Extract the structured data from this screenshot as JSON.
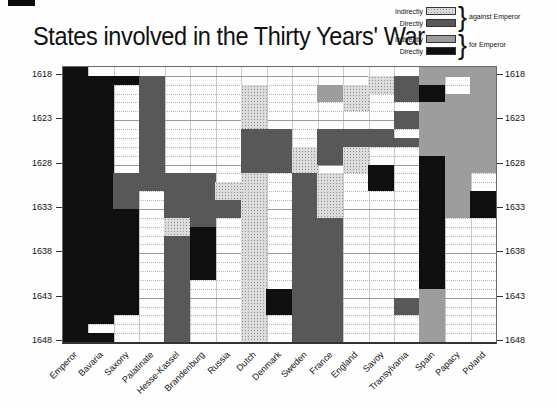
{
  "title": "States involved in the Thirty Years' War",
  "legend": {
    "brace": "}",
    "groups": [
      {
        "label": "against Emperor",
        "rows": [
          {
            "label": "Indirectly",
            "code": "IA"
          },
          {
            "label": "Directly",
            "code": "DA"
          }
        ]
      },
      {
        "label": "for Emperor",
        "rows": [
          {
            "label": "Indirectly",
            "code": "IF"
          },
          {
            "label": "Directly",
            "code": "DF"
          }
        ]
      }
    ]
  },
  "colors": {
    "indirect_against_bg": "#dcdcdc",
    "indirect_against_dot": "#8f8f8f",
    "direct_against": "#585858",
    "indirect_for": "#9d9d9d",
    "direct_for": "#0f0f0f",
    "grid_solid": "#9a9a9a",
    "grid_dotted": "#b3b3b3",
    "frame": "#6a6a6a"
  },
  "chart_data": {
    "type": "heatmap",
    "title": "States involved in the Thirty Years' War",
    "x_categories": [
      "Emperor",
      "Bavaria",
      "Saxony",
      "Palatinate",
      "Hesse-Kassel",
      "Brandenburg",
      "Russia",
      "Dutch",
      "Denmark",
      "Sweden",
      "France",
      "England",
      "Savoy",
      "Transylvania",
      "Spain",
      "Papacy",
      "Poland"
    ],
    "y_min": 1618,
    "y_max": 1648,
    "y_ticks": [
      1618,
      1623,
      1628,
      1633,
      1638,
      1643,
      1648
    ],
    "grid": "yearly dotted horizontal lines, solid lines every 5 years, vertical lines at column bounds",
    "codes": {
      "IA": "Indirectly against Emperor (stippled light gray)",
      "DA": "Directly against Emperor (dark gray)",
      "IF": "Indirectly for Emperor (medium gray)",
      "DF": "Directly for Emperor (black)",
      "default": "not involved (white)"
    },
    "states": [
      {
        "name": "Emperor",
        "segments": [
          [
            1618,
            1648,
            "DF"
          ]
        ]
      },
      {
        "name": "Bavaria",
        "segments": [
          [
            1619,
            1646,
            "DF"
          ],
          [
            1648,
            1648,
            "DF"
          ]
        ]
      },
      {
        "name": "Saxony",
        "segments": [
          [
            1619,
            1619,
            "DF"
          ],
          [
            1630,
            1633,
            "DA"
          ],
          [
            1634,
            1645,
            "DF"
          ]
        ]
      },
      {
        "name": "Palatinate",
        "segments": [
          [
            1619,
            1631,
            "DA"
          ]
        ]
      },
      {
        "name": "Hesse-Kassel",
        "segments": [
          [
            1630,
            1634,
            "DA"
          ],
          [
            1635,
            1636,
            "IA"
          ],
          [
            1637,
            1648,
            "DA"
          ]
        ]
      },
      {
        "name": "Brandenburg",
        "segments": [
          [
            1630,
            1635,
            "DA"
          ],
          [
            1636,
            1641,
            "DF"
          ]
        ]
      },
      {
        "name": "Russia",
        "segments": [
          [
            1631,
            1632,
            "IA"
          ],
          [
            1633,
            1634,
            "DA"
          ]
        ]
      },
      {
        "name": "Dutch",
        "segments": [
          [
            1620,
            1624,
            "IA"
          ],
          [
            1625,
            1629,
            "DA"
          ],
          [
            1630,
            1648,
            "IA"
          ]
        ]
      },
      {
        "name": "Denmark",
        "segments": [
          [
            1625,
            1629,
            "DA"
          ],
          [
            1643,
            1645,
            "DF"
          ]
        ]
      },
      {
        "name": "Sweden",
        "segments": [
          [
            1627,
            1629,
            "IA"
          ],
          [
            1630,
            1648,
            "DA"
          ]
        ]
      },
      {
        "name": "France",
        "segments": [
          [
            1620,
            1621,
            "IF"
          ],
          [
            1625,
            1628,
            "DA"
          ],
          [
            1630,
            1634,
            "IA"
          ],
          [
            1635,
            1648,
            "DA"
          ]
        ]
      },
      {
        "name": "England",
        "segments": [
          [
            1620,
            1622,
            "IA"
          ],
          [
            1625,
            1626,
            "DA"
          ],
          [
            1627,
            1629,
            "IA"
          ]
        ]
      },
      {
        "name": "Savoy",
        "segments": [
          [
            1619,
            1620,
            "IA"
          ],
          [
            1625,
            1626,
            "DA"
          ],
          [
            1629,
            1631,
            "DF"
          ]
        ]
      },
      {
        "name": "Transylvania",
        "segments": [
          [
            1619,
            1621,
            "DA"
          ],
          [
            1623,
            1624,
            "DA"
          ],
          [
            1626,
            1626,
            "DA"
          ],
          [
            1644,
            1645,
            "DA"
          ]
        ]
      },
      {
        "name": "Spain",
        "segments": [
          [
            1618,
            1619,
            "IF"
          ],
          [
            1620,
            1621,
            "DF"
          ],
          [
            1622,
            1627,
            "IF"
          ],
          [
            1628,
            1642,
            "DF"
          ],
          [
            1643,
            1648,
            "IF"
          ]
        ]
      },
      {
        "name": "Papacy",
        "segments": [
          [
            1618,
            1618,
            "IF"
          ],
          [
            1621,
            1634,
            "IF"
          ]
        ]
      },
      {
        "name": "Poland",
        "segments": [
          [
            1618,
            1629,
            "IF"
          ],
          [
            1632,
            1634,
            "DF"
          ]
        ]
      }
    ]
  }
}
